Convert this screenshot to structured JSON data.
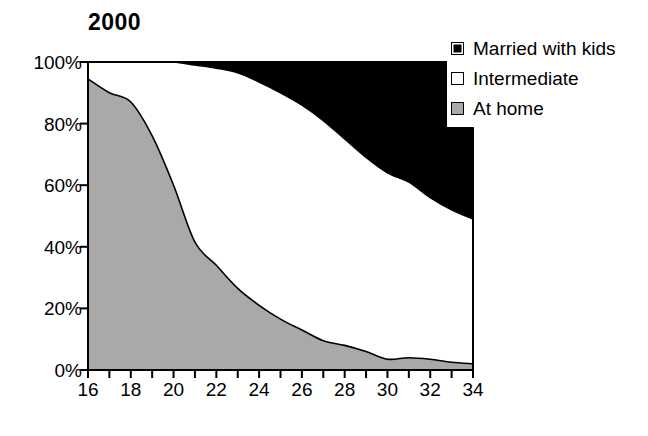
{
  "chart_data": {
    "type": "area",
    "title": "2000",
    "xlabel": "",
    "ylabel": "",
    "xlim": [
      16,
      34
    ],
    "ylim": [
      0,
      100
    ],
    "grid": false,
    "stacked": true,
    "stack_total": 100,
    "legend_position": "top-right",
    "x": [
      16,
      17,
      18,
      19,
      20,
      21,
      22,
      23,
      24,
      25,
      26,
      27,
      28,
      29,
      30,
      31,
      32,
      33,
      34
    ],
    "x_tick_labels": [
      "16",
      "18",
      "20",
      "22",
      "24",
      "26",
      "28",
      "30",
      "32",
      "34"
    ],
    "x_tick_values": [
      16,
      18,
      20,
      22,
      24,
      26,
      28,
      30,
      32,
      34
    ],
    "x_minor_ticks": [
      16,
      17,
      18,
      19,
      20,
      21,
      22,
      23,
      24,
      25,
      26,
      27,
      28,
      29,
      30,
      31,
      32,
      33,
      34
    ],
    "y_tick_labels": [
      "0%",
      "20%",
      "40%",
      "60%",
      "80%",
      "100%"
    ],
    "y_tick_values": [
      0,
      20,
      40,
      60,
      80,
      100
    ],
    "series": [
      {
        "name": "At home",
        "color": "#a9a9a9",
        "order": 1,
        "values": [
          94.5,
          90.0,
          87.0,
          76.0,
          60.0,
          41.5,
          34.0,
          26.5,
          21.0,
          16.5,
          13.0,
          9.5,
          8.0,
          6.0,
          3.5,
          4.0,
          3.5,
          2.5,
          2.0
        ]
      },
      {
        "name": "Intermediate",
        "color": "#ffffff",
        "order": 2,
        "values": [
          5.5,
          10.0,
          13.0,
          24.0,
          40.0,
          57.5,
          64.0,
          70.0,
          72.5,
          73.5,
          73.0,
          71.5,
          67.0,
          63.0,
          60.5,
          57.0,
          52.5,
          49.5,
          47.0
        ]
      },
      {
        "name": "Married with kids",
        "color": "#000000",
        "order": 3,
        "values": [
          0.0,
          0.0,
          0.0,
          0.0,
          0.0,
          1.0,
          2.0,
          3.5,
          6.5,
          10.0,
          14.0,
          19.0,
          25.0,
          31.0,
          36.0,
          39.0,
          44.0,
          48.0,
          51.0
        ]
      }
    ],
    "boundaries": {
      "at_home_top": [
        94.5,
        90.0,
        87.0,
        76.0,
        60.0,
        41.5,
        34.0,
        26.5,
        21.0,
        16.5,
        13.0,
        9.5,
        8.0,
        6.0,
        3.5,
        4.0,
        3.5,
        2.5,
        2.0
      ],
      "intermediate_top": [
        100,
        100,
        100,
        100,
        100,
        99.0,
        98.0,
        96.5,
        93.5,
        90.0,
        86.0,
        81.0,
        75.0,
        69.0,
        64.0,
        61.0,
        56.0,
        52.0,
        49.0
      ]
    }
  },
  "legend": {
    "items": [
      {
        "label": "Married with kids",
        "swatch": "black"
      },
      {
        "label": "Intermediate",
        "swatch": "white"
      },
      {
        "label": "At home",
        "swatch": "gray"
      }
    ]
  },
  "caption": {
    "text": ""
  }
}
